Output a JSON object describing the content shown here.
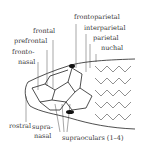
{
  "diagram": {
    "labels": {
      "frontal": "frontal",
      "prefrontal": "prefrontal",
      "frontonasal_1": "fronto-",
      "frontonasal_2": "nasal",
      "frontoparietal": "frontoparietal",
      "interparietal": "interparietal",
      "parietal": "parietal",
      "nuchal": "nuchal",
      "rostral": "rostral",
      "supranasal_1": "supra-",
      "supranasal_2": "nasal",
      "supraoculars": "supraoculars (1–4)"
    }
  }
}
